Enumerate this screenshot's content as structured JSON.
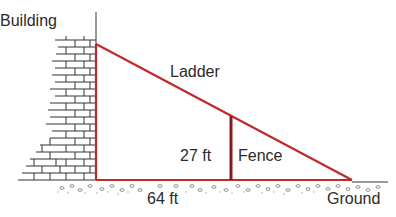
{
  "diagram": {
    "labels": {
      "building": "Building",
      "ladder": "Ladder",
      "fence_height": "27 ft",
      "fence": "Fence",
      "base_distance": "64 ft",
      "ground": "Ground"
    },
    "colors": {
      "ladder": "#c0282a",
      "fence": "#8b1a1f",
      "brick": "#333333",
      "ground_texture": "#777777"
    }
  }
}
